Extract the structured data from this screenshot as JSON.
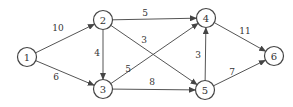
{
  "diagram": {
    "type": "directed-weighted-graph",
    "nodes": [
      {
        "id": "1",
        "label": "1",
        "x": 27,
        "y": 57
      },
      {
        "id": "2",
        "label": "2",
        "x": 103,
        "y": 20
      },
      {
        "id": "3",
        "label": "3",
        "x": 103,
        "y": 89
      },
      {
        "id": "4",
        "label": "4",
        "x": 206,
        "y": 18
      },
      {
        "id": "5",
        "label": "5",
        "x": 205,
        "y": 90
      },
      {
        "id": "6",
        "label": "6",
        "x": 274,
        "y": 56
      }
    ],
    "edges": [
      {
        "from": "1",
        "to": "2",
        "weight": "10",
        "lx": 58,
        "ly": 28
      },
      {
        "from": "1",
        "to": "3",
        "weight": "6",
        "lx": 56,
        "ly": 77
      },
      {
        "from": "2",
        "to": "3",
        "weight": "4",
        "lx": 97,
        "ly": 53
      },
      {
        "from": "2",
        "to": "4",
        "weight": "5",
        "lx": 145,
        "ly": 13
      },
      {
        "from": "2",
        "to": "5",
        "weight": "3",
        "lx": 144,
        "ly": 40
      },
      {
        "from": "3",
        "to": "4",
        "weight": "5",
        "lx": 128,
        "ly": 69
      },
      {
        "from": "3",
        "to": "5",
        "weight": "8",
        "lx": 152,
        "ly": 82
      },
      {
        "from": "5",
        "to": "4",
        "weight": "3",
        "lx": 198,
        "ly": 55
      },
      {
        "from": "4",
        "to": "6",
        "weight": "11",
        "lx": 245,
        "ly": 31
      },
      {
        "from": "5",
        "to": "6",
        "weight": "7",
        "lx": 232,
        "ly": 72
      }
    ]
  }
}
